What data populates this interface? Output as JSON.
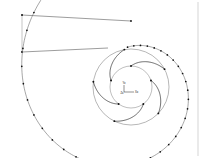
{
  "figure": {
    "background_color": "#ffffff",
    "line_color": "#555555",
    "node_color": "#111111",
    "blade_color": "#3a3a3a",
    "width": 210,
    "height": 158
  },
  "chart_data": {
    "type": "diagram",
    "xlabel": "Xo",
    "ylabel": "Yo",
    "grid": false,
    "legend": "none",
    "xlim": [
      0,
      210
    ],
    "ylim": [
      0,
      158
    ]
  },
  "axes_triad": {
    "name": "origin-axis-triad",
    "origin_x": 131,
    "origin_y": 87,
    "y_label": "Yo",
    "x_label": "Xo",
    "origin_label": "Zo"
  },
  "impeller": {
    "name": "impeller",
    "center_x": 131,
    "center_y": 87,
    "hub_radius": 21,
    "tip_radius": 38,
    "blade_count": 5,
    "blade_wrap_deg": 62,
    "blade_nodes_per_blade": 2
  },
  "volute": {
    "name": "volute-spiral",
    "center_x": 131,
    "center_y": 87,
    "start_radius": 40,
    "growth": 0.205,
    "turns_deg": 375,
    "node_count": 42,
    "start_angle_deg": -95
  },
  "discharge_duct": {
    "name": "discharge-duct",
    "top_left_x": 22,
    "top_left_y": 15,
    "top_right_x": 131,
    "top_right_y": 21,
    "bottom_left_x": 22,
    "bottom_left_y": 52,
    "bottom_right_x": 108,
    "bottom_right_y": 48,
    "end_nodes": 2
  },
  "reference_line": {
    "name": "right-reference-line",
    "x": 198,
    "y_start": 2,
    "y_end": 156
  }
}
